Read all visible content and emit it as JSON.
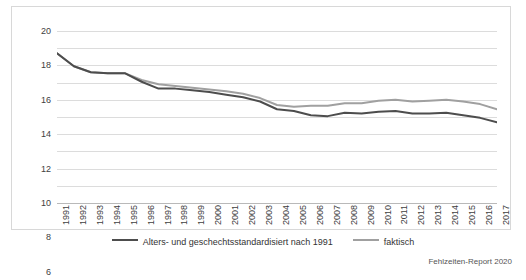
{
  "chart_data": {
    "type": "line",
    "title": "",
    "xlabel": "",
    "ylabel": "",
    "ylim": [
      0,
      20
    ],
    "yticks": [
      0,
      2,
      4,
      6,
      8,
      10,
      12,
      14,
      16,
      18,
      20
    ],
    "grid": true,
    "legend_position": "bottom",
    "categories": [
      "1991",
      "1992",
      "1993",
      "1994",
      "1995",
      "1996",
      "1997",
      "1998",
      "1999",
      "2000",
      "2001",
      "2002",
      "2003",
      "2004",
      "2005",
      "2006",
      "2007",
      "2008",
      "2009",
      "2010",
      "2011",
      "2012",
      "2013",
      "2014",
      "2015",
      "2016",
      "2017"
    ],
    "series": [
      {
        "name": "Alters- und geschechtsstandardisiert nach 1991",
        "color": "#4d4d4d",
        "values": [
          17.4,
          15.9,
          15.2,
          15.1,
          15.1,
          14.1,
          13.3,
          13.3,
          13.1,
          12.9,
          12.6,
          12.3,
          11.8,
          10.9,
          10.7,
          10.2,
          10.1,
          10.5,
          10.4,
          10.6,
          10.7,
          10.4,
          10.4,
          10.5,
          10.2,
          9.9,
          9.4
        ]
      },
      {
        "name": "faktisch",
        "color": "#a0a0a0",
        "values": [
          17.4,
          15.9,
          15.2,
          15.1,
          15.1,
          14.3,
          13.8,
          13.6,
          13.4,
          13.2,
          13.0,
          12.7,
          12.2,
          11.4,
          11.2,
          11.3,
          11.3,
          11.6,
          11.6,
          11.9,
          12.0,
          11.8,
          11.9,
          12.0,
          11.8,
          11.5,
          10.9
        ]
      }
    ]
  },
  "legend": {
    "items": [
      {
        "label": "Alters- und geschechtsstandardisiert nach 1991",
        "color": "#4d4d4d"
      },
      {
        "label": "faktisch",
        "color": "#a0a0a0"
      }
    ]
  },
  "credit": "Fehlzeiten-Report 2020"
}
